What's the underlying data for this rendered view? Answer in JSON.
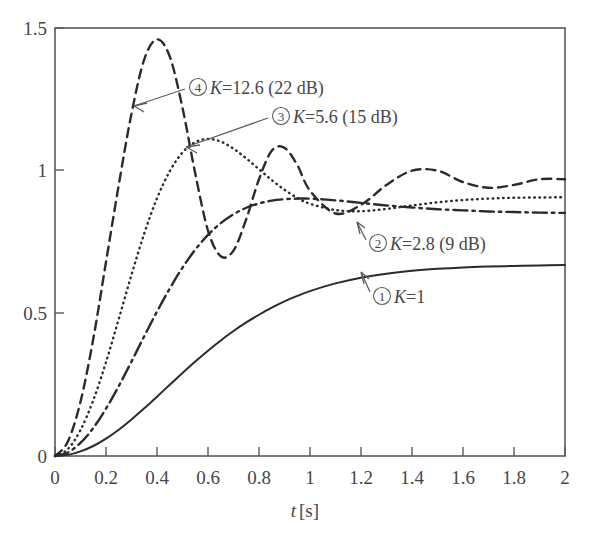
{
  "chart_data": {
    "type": "line",
    "title": "",
    "xlabel": "t [s]",
    "ylabel": "",
    "xlim": [
      0,
      2
    ],
    "ylim": [
      0,
      1.5
    ],
    "grid": false,
    "legend_position": "inline-annotations",
    "x_ticks": [
      "0",
      "0.2",
      "0.4",
      "0.6",
      "0.8",
      "1",
      "1.2",
      "1.4",
      "1.6",
      "1.8",
      "2"
    ],
    "x_tick_values": [
      0,
      0.2,
      0.4,
      0.6,
      0.8,
      1.0,
      1.2,
      1.4,
      1.6,
      1.8,
      2.0
    ],
    "y_ticks": [
      "0",
      "0.5",
      "1",
      "1.5"
    ],
    "y_tick_values": [
      0,
      0.5,
      1.0,
      1.5
    ],
    "x": [
      0,
      0.05,
      0.1,
      0.15,
      0.2,
      0.25,
      0.3,
      0.35,
      0.4,
      0.45,
      0.5,
      0.55,
      0.6,
      0.65,
      0.7,
      0.75,
      0.8,
      0.85,
      0.9,
      0.95,
      1.0,
      1.1,
      1.2,
      1.3,
      1.4,
      1.5,
      1.6,
      1.7,
      1.8,
      1.9,
      2.0
    ],
    "series": [
      {
        "name": "1",
        "marker_label": "①",
        "label": "① K=1",
        "gain_K": 1,
        "gain_dB": null,
        "style": "solid",
        "steady_state": 0.67,
        "overshoot_peak": null,
        "values": [
          0.0,
          0.004,
          0.016,
          0.035,
          0.061,
          0.092,
          0.128,
          0.167,
          0.208,
          0.25,
          0.291,
          0.331,
          0.369,
          0.405,
          0.438,
          0.468,
          0.495,
          0.52,
          0.542,
          0.561,
          0.578,
          0.605,
          0.625,
          0.639,
          0.649,
          0.656,
          0.661,
          0.664,
          0.666,
          0.668,
          0.669
        ]
      },
      {
        "name": "2",
        "marker_label": "②",
        "label": "② K=2.8 (9 dB)",
        "gain_K": 2.8,
        "gain_dB": 9,
        "style": "dash-dot",
        "steady_state": 0.85,
        "overshoot_peak": 0.93,
        "overshoot_time": 0.55,
        "values": [
          0.0,
          0.012,
          0.046,
          0.098,
          0.166,
          0.245,
          0.331,
          0.42,
          0.506,
          0.587,
          0.66,
          0.723,
          0.775,
          0.816,
          0.847,
          0.87,
          0.885,
          0.895,
          0.9,
          0.902,
          0.902,
          0.896,
          0.887,
          0.878,
          0.871,
          0.865,
          0.861,
          0.857,
          0.855,
          0.853,
          0.852
        ]
      },
      {
        "name": "3",
        "marker_label": "③",
        "label": "③ K=5.6 (15 dB)",
        "gain_K": 5.6,
        "gain_dB": 15,
        "style": "dotted",
        "steady_state": 0.91,
        "overshoot_peak": 1.15,
        "overshoot_time": 0.32,
        "values": [
          0.0,
          0.024,
          0.091,
          0.195,
          0.329,
          0.48,
          0.635,
          0.78,
          0.903,
          0.998,
          1.064,
          1.1,
          1.111,
          1.102,
          1.077,
          1.043,
          1.005,
          0.967,
          0.933,
          0.905,
          0.884,
          0.862,
          0.858,
          0.866,
          0.878,
          0.889,
          0.897,
          0.902,
          0.905,
          0.906,
          0.907
        ]
      },
      {
        "name": "4",
        "marker_label": "④",
        "label": "④ K=12.6 (22 dB)",
        "gain_K": 12.6,
        "gain_dB": 22,
        "style": "dashed",
        "steady_state": 0.97,
        "overshoot_peak": 1.46,
        "overshoot_time": 0.23,
        "first_trough": 0.7,
        "first_trough_time": 0.43,
        "second_peak": 1.08,
        "second_peak_time": 0.64,
        "values": [
          0.0,
          0.05,
          0.19,
          0.41,
          0.68,
          0.95,
          1.2,
          1.39,
          1.46,
          1.4,
          1.22,
          0.99,
          0.79,
          0.7,
          0.72,
          0.83,
          0.97,
          1.07,
          1.08,
          1.02,
          0.93,
          0.85,
          0.88,
          0.95,
          1.0,
          1.0,
          0.96,
          0.94,
          0.95,
          0.97,
          0.97
        ]
      }
    ],
    "annotations": [
      {
        "id": "annot-4",
        "text_circle": "④",
        "text": " K=12.6 (22 dB)",
        "points_to_series": "4"
      },
      {
        "id": "annot-3",
        "text_circle": "③",
        "text": " K=5.6 (15 dB)",
        "points_to_series": "3"
      },
      {
        "id": "annot-2",
        "text_circle": "②",
        "text": " K=2.8 (9 dB)",
        "points_to_series": "2"
      },
      {
        "id": "annot-1",
        "text_circle": "①",
        "text": " K=1",
        "points_to_series": "1"
      }
    ]
  },
  "axis": {
    "x_label_var": "t",
    "x_label_unit": "[s]"
  },
  "colors": {
    "curve": "#2b2b2b",
    "frame": "#5a5a5e",
    "text": "#46464a",
    "background": "#ffffff"
  }
}
